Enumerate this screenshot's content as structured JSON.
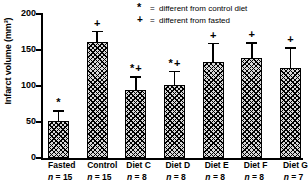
{
  "chart_data": {
    "type": "bar",
    "title": "",
    "xlabel": "",
    "ylabel": "Infarct volume (mm³)",
    "ylim": [
      0,
      200
    ],
    "yticks": [
      0,
      50,
      100,
      150,
      200
    ],
    "grid": false,
    "categories": [
      "Fasted",
      "Control",
      "Diet C",
      "Diet D",
      "Diet E",
      "Diet F",
      "Diet G"
    ],
    "values": [
      51,
      161,
      94,
      101,
      133,
      139,
      125
    ],
    "error_upper": [
      66,
      177,
      114,
      121,
      160,
      161,
      154
    ],
    "sample_sizes": [
      "n = 15",
      "n = 15",
      "n = 8",
      "n = 8",
      "n = 8",
      "n = 8",
      "n = 7"
    ],
    "annotations": [
      "*",
      "+",
      "* +",
      "* +",
      "+",
      "+",
      "+"
    ],
    "legend_position": "top-right",
    "legend": [
      {
        "symbol": "*",
        "equals": "=",
        "text": "different from control diet"
      },
      {
        "symbol": "+",
        "equals": "=",
        "text": "different from fasted"
      }
    ]
  },
  "axis": {
    "tick_labels": [
      "200",
      "150",
      "100",
      "50",
      "0"
    ]
  },
  "colors": {
    "ink": "#000000",
    "background": "#ffffff",
    "bar_fill": "#d8d8d8"
  }
}
